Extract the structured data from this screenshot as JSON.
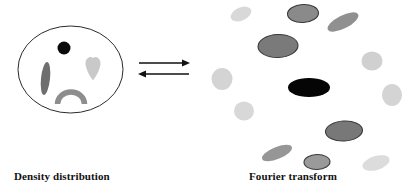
{
  "figure": {
    "width": 418,
    "height": 193,
    "background": "#ffffff"
  },
  "left_panel": {
    "caption": "Density distribution",
    "boundary": {
      "shape": "ellipse",
      "cx": 70.5,
      "cy": 69.5,
      "rx": 52.5,
      "ry": 43.5,
      "stroke": "#2b2b2b",
      "fill": "#ffffff"
    },
    "features": [
      {
        "name": "black-dot",
        "shape": "circle",
        "cx": 64,
        "cy": 48,
        "r": 6.5,
        "color": "#0b0b0b"
      },
      {
        "name": "dark-streak",
        "shape": "ellipse",
        "cx": 45.5,
        "cy": 78.5,
        "rx": 4.5,
        "ry": 16.5,
        "rot": 6,
        "color": "#6f6f6f"
      },
      {
        "name": "heart",
        "shape": "path",
        "cx": 93,
        "cy": 68,
        "color": "#c9c9c9"
      },
      {
        "name": "frown-arc",
        "shape": "arc",
        "cx": 71,
        "cy": 102,
        "rx": 13.5,
        "ry": 11.5,
        "color": "#8d8d8d"
      }
    ]
  },
  "arrows": {
    "name": "reversible-transform-arrows",
    "top": {
      "direction": "right",
      "x1": 139,
      "x2": 189,
      "y": 63,
      "color": "#111111"
    },
    "bottom": {
      "direction": "left",
      "x1": 189,
      "x2": 139,
      "y": 74,
      "color": "#111111"
    }
  },
  "right_panel": {
    "caption": "Fourier transform",
    "spots": [
      {
        "name": "spot-light-tl",
        "cx": 241,
        "cy": 14,
        "rx": 11,
        "ry": 6.5,
        "rot": -24,
        "fill": "#d8d8d8",
        "stroke": "none"
      },
      {
        "name": "spot-mid-top",
        "cx": 303,
        "cy": 13.5,
        "rx": 15.5,
        "ry": 9,
        "rot": -3,
        "fill": "#8a8a8a",
        "stroke": "#3a3a3a"
      },
      {
        "name": "spot-dark-tilt-tr",
        "cx": 343,
        "cy": 22,
        "rx": 17,
        "ry": 6.5,
        "rot": -27,
        "fill": "#909090",
        "stroke": "none"
      },
      {
        "name": "spot-large-dark",
        "cx": 278,
        "cy": 46,
        "rx": 20,
        "ry": 11.5,
        "rot": -2,
        "fill": "#7a7a7a",
        "stroke": "#3a3a3a"
      },
      {
        "name": "spot-light-right-1",
        "cx": 372,
        "cy": 61,
        "rx": 10.5,
        "ry": 9.5,
        "rot": 0,
        "fill": "#d0d0d0",
        "stroke": "none"
      },
      {
        "name": "spot-light-left-1",
        "cx": 222,
        "cy": 79,
        "rx": 10.5,
        "ry": 11,
        "rot": 0,
        "fill": "#d4d4d4",
        "stroke": "none"
      },
      {
        "name": "spot-black-center",
        "cx": 309,
        "cy": 87.5,
        "rx": 21,
        "ry": 9.5,
        "rot": 0,
        "fill": "#050505",
        "stroke": "none"
      },
      {
        "name": "spot-light-right-2",
        "cx": 392,
        "cy": 95,
        "rx": 10,
        "ry": 11,
        "rot": 0,
        "fill": "#d4d4d4",
        "stroke": "none"
      },
      {
        "name": "spot-light-left-2",
        "cx": 244,
        "cy": 111,
        "rx": 10,
        "ry": 9.5,
        "rot": 0,
        "fill": "#d8d8d8",
        "stroke": "none"
      },
      {
        "name": "spot-dark-lr",
        "cx": 344,
        "cy": 131,
        "rx": 18.5,
        "ry": 10,
        "rot": -3,
        "fill": "#787878",
        "stroke": "#3a3a3a"
      },
      {
        "name": "spot-mid-tilt-bl",
        "cx": 277,
        "cy": 153,
        "rx": 16,
        "ry": 6,
        "rot": -22,
        "fill": "#969696",
        "stroke": "none"
      },
      {
        "name": "spot-mid-bottom",
        "cx": 317,
        "cy": 162,
        "rx": 13,
        "ry": 7.5,
        "rot": -2,
        "fill": "#9a9a9a",
        "stroke": "#3a3a3a"
      },
      {
        "name": "spot-light-br",
        "cx": 376,
        "cy": 163,
        "rx": 14,
        "ry": 7,
        "rot": -17,
        "fill": "#dcdcdc",
        "stroke": "none"
      }
    ]
  }
}
